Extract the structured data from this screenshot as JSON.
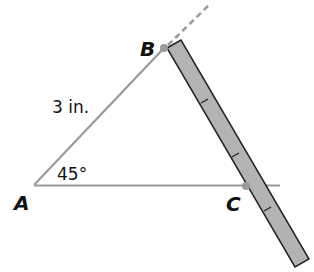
{
  "diagram": {
    "points": {
      "A": {
        "label": "A",
        "x": 34,
        "y": 185
      },
      "B": {
        "label": "B",
        "x": 164,
        "y": 48
      },
      "C": {
        "label": "C",
        "x": 246,
        "y": 186
      }
    },
    "side_AB_label": "3 in.",
    "angle_A_label": "45°",
    "colors": {
      "segment": "#9a9a9a",
      "ruler_fill": "#b3b3b3",
      "ruler_stroke": "#222222",
      "point": "#9a9a9a",
      "dashed": "#9a9a9a"
    }
  }
}
